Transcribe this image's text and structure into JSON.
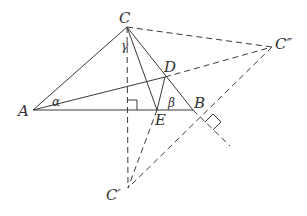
{
  "diagram": {
    "type": "geometry",
    "colors": {
      "stroke": "#3a3a3a",
      "label": "#333333",
      "background": "#ffffff"
    },
    "points": {
      "A": {
        "label": "A",
        "x": 33,
        "y": 110,
        "lx": 18,
        "ly": 116
      },
      "B": {
        "label": "B",
        "x": 193,
        "y": 110,
        "lx": 194,
        "ly": 108
      },
      "C": {
        "label": "C",
        "x": 127,
        "y": 27,
        "lx": 119,
        "ly": 23
      },
      "D": {
        "label": "D",
        "x": 165,
        "y": 77,
        "lx": 164,
        "ly": 72
      },
      "E": {
        "label": "E",
        "x": 157,
        "y": 110,
        "lx": 155,
        "ly": 125
      },
      "C1": {
        "label": "C′",
        "x": 128,
        "y": 188,
        "lx": 106,
        "ly": 200
      },
      "C2": {
        "label": "C″",
        "x": 272,
        "y": 47,
        "lx": 275,
        "ly": 49
      }
    },
    "angles": {
      "alpha": {
        "label": "α",
        "x": 52,
        "y": 106
      },
      "beta": {
        "label": "β",
        "x": 168,
        "y": 107
      },
      "gamma": {
        "label": "γ",
        "x": 122,
        "y": 50
      }
    }
  }
}
